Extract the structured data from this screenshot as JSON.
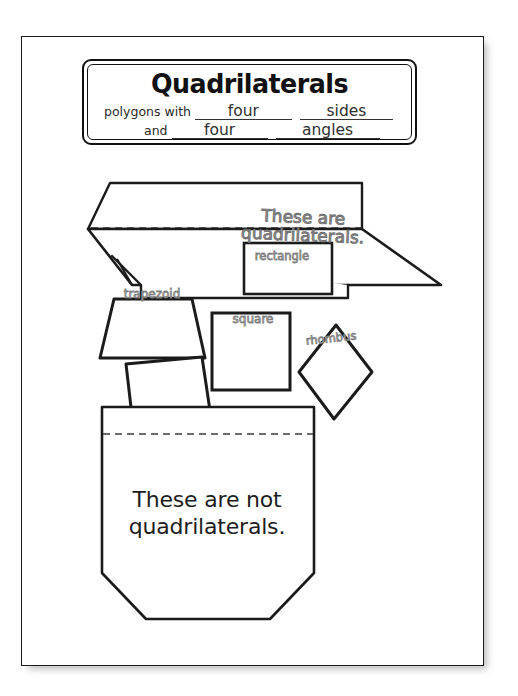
{
  "document": {
    "kind": "printable-worksheet-scan",
    "title_card": {
      "heading": "Quadrilaterals",
      "line1_lead": "polygons with",
      "line1_blank1": "four",
      "line1_blank2": "sides",
      "line2_lead": "and",
      "line2_blank1": "four",
      "line2_blank2": "angles"
    },
    "top_flap": {
      "text_line1": "These are",
      "text_line2": "quadrilaterals."
    },
    "bottom_pocket": {
      "text_line1": "These are not",
      "text_line2": "quadrilaterals."
    },
    "shapes": [
      {
        "name": "rectangle",
        "label": "rectangle"
      },
      {
        "name": "trapezoid",
        "label": "trapezoid"
      },
      {
        "name": "square",
        "label": "square"
      },
      {
        "name": "rhombus",
        "label": "rhombus"
      },
      {
        "name": "parallelogram-unlabeled",
        "label": ""
      },
      {
        "name": "quadrilateral-unlabeled",
        "label": ""
      }
    ],
    "colors": {
      "ink": "#111111",
      "paper": "#ffffff",
      "label_outline": "#7d7d7d",
      "flap_text": "#6f6f6f",
      "page_shadow": "rgba(90,90,90,0.40)"
    }
  }
}
